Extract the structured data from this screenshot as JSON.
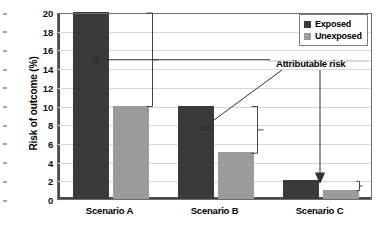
{
  "chart_data": {
    "type": "bar",
    "title": "",
    "subtitle": "",
    "xlabel": "",
    "ylabel": "Risk of outcome (%)",
    "ylim": [
      0,
      20
    ],
    "ytick_values": [
      0,
      2,
      4,
      6,
      8,
      10,
      12,
      14,
      16,
      18,
      20
    ],
    "ytick_labels": [
      "0",
      "2",
      "4",
      "6",
      "8",
      "10",
      "12",
      "14",
      "16",
      "18",
      "20"
    ],
    "grid": true,
    "grid_axis": "y",
    "legend_position": "top-right",
    "categories": [
      "Scenario A",
      "Scenario B",
      "Scenario C"
    ],
    "series": [
      {
        "name": "Exposed",
        "color": "#3a3a3a",
        "values": [
          20,
          10,
          2
        ]
      },
      {
        "name": "Unexposed",
        "color": "#9b9b9b",
        "values": [
          10,
          5,
          1
        ]
      }
    ],
    "annotations": [
      {
        "label": "Attributable risk",
        "targets": [
          "Scenario A",
          "Scenario B",
          "Scenario C"
        ],
        "values": [
          10,
          5,
          1
        ],
        "description": "Bracket between exposed and unexposed bar tops in each scenario, all pointing to the shared 'Attributable risk' label"
      }
    ]
  },
  "legend": {
    "items": [
      {
        "label": "Exposed",
        "color": "#3a3a3a"
      },
      {
        "label": "Unexposed",
        "color": "#9b9b9b"
      }
    ]
  },
  "annotation": {
    "label": "Attributable risk"
  },
  "colors": {
    "exposed": "#3a3a3a",
    "unexposed": "#9b9b9b",
    "grid": "#d8d8d8",
    "axis": "#4a4a4a",
    "text": "#000000",
    "background": "#ffffff"
  }
}
